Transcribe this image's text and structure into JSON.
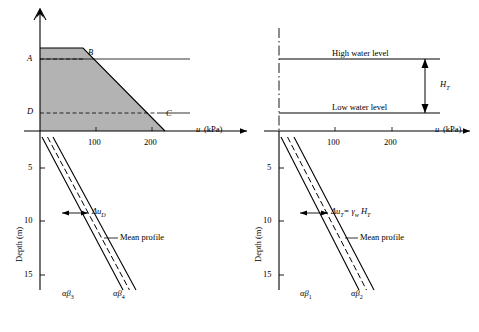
{
  "figure": {
    "type": "engineering-diagram"
  },
  "left_panel": {
    "embankment_points": [
      "A",
      "B",
      "C",
      "D"
    ],
    "axis": {
      "x_label": "u",
      "x_units": "(kPa)",
      "x_ticks": [
        "100",
        "200"
      ],
      "y_label": "Depth (m)",
      "y_ticks": [
        "5",
        "10",
        "15"
      ]
    },
    "annotations": [
      {
        "text": "Δu",
        "sub": "D"
      },
      {
        "text": "Mean profile"
      },
      {
        "text": "αβ",
        "sub": "3"
      },
      {
        "text": "αβ",
        "sub": "4"
      }
    ]
  },
  "right_panel": {
    "labels": {
      "high_water": "High water level",
      "low_water": "Low water level",
      "head": "H",
      "head_sub": "T"
    },
    "axis": {
      "x_label": "u",
      "x_units": "(kPa)",
      "x_ticks": [
        "100",
        "200"
      ],
      "y_label": "Depth (m)",
      "y_ticks": [
        "5",
        "10",
        "15"
      ]
    },
    "annotations": [
      {
        "text": "Δu",
        "sub": "T",
        "eq": "= γ",
        "eq_sub": "w",
        "eq_tail": " H",
        "eq_tail_sub": "T"
      },
      {
        "text": "Mean profile"
      },
      {
        "text": "αβ",
        "sub": "1"
      },
      {
        "text": "αβ",
        "sub": "2"
      }
    ]
  },
  "colors": {
    "line": "#000000",
    "fill": "#b3b3b3",
    "background": "#ffffff"
  }
}
